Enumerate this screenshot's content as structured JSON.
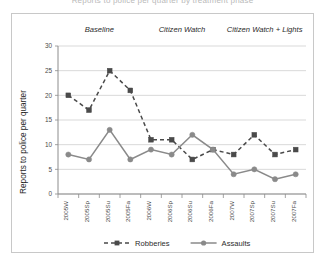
{
  "figure": {
    "clipped_caption": "Reports to police per quarter by treatment phase",
    "colors": {
      "robberies": "#4a4a4a",
      "assaults": "#8a8a8a",
      "grid": "#c9c9c9",
      "axis": "#8c8c8c",
      "frame": "#c8c8c8",
      "text": "#2b2b2b"
    }
  },
  "chart_data": {
    "type": "line",
    "title": "",
    "xlabel": "",
    "ylabel": "Reports to police per quarter",
    "ylim": [
      0,
      30
    ],
    "yticks": [
      0,
      5,
      10,
      15,
      20,
      25,
      30
    ],
    "ytick_labels": [
      "0",
      "5",
      "10",
      "15",
      "20",
      "25",
      "30"
    ],
    "grid": true,
    "legend_position": "bottom",
    "categories": [
      "2005W",
      "2005Sp",
      "2005Su",
      "2005Fa",
      "2006W",
      "2006Sp",
      "2006Su",
      "2006Fa",
      "2007W",
      "2007Sp",
      "2007Su",
      "2007Fa"
    ],
    "series": [
      {
        "name": "Robberies",
        "marker": "square",
        "linestyle": "dashed",
        "color": "#4a4a4a",
        "values": [
          20,
          17,
          25,
          21,
          11,
          11,
          7,
          9,
          8,
          12,
          8,
          9
        ]
      },
      {
        "name": "Assaults",
        "marker": "circle",
        "linestyle": "solid",
        "color": "#8a8a8a",
        "values": [
          8,
          7,
          13,
          7,
          9,
          8,
          12,
          9,
          4,
          5,
          3,
          4
        ]
      }
    ],
    "annotations": [
      {
        "label": "Baseline",
        "start_index": 0,
        "end_index": 3
      },
      {
        "label": "Citizen Watch",
        "start_index": 4,
        "end_index": 7
      },
      {
        "label": "Citizen Watch + Lights",
        "start_index": 8,
        "end_index": 11
      }
    ]
  },
  "legend": {
    "items": [
      {
        "label": "Robberies"
      },
      {
        "label": "Assaults"
      }
    ]
  }
}
